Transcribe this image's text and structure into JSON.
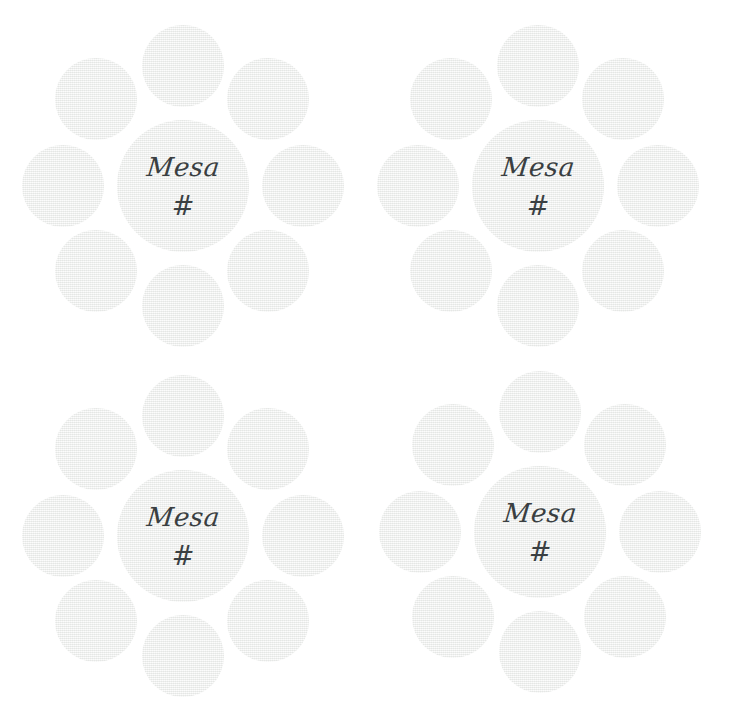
{
  "page": {
    "background_color": "#ffffff",
    "width": 729,
    "height": 713
  },
  "style": {
    "circle_fill": "#f1f2f1",
    "label_color": "#3a3f42",
    "texture": "linen-weave"
  },
  "cluster_template": {
    "center_label_name": "Mesa",
    "center_label_hash": "#",
    "satellite_count": 8,
    "satellite_positions": [
      "n",
      "ne",
      "e",
      "se",
      "s",
      "sw",
      "w",
      "nw"
    ]
  },
  "clusters": [
    {
      "id": "top-left",
      "name": "Mesa",
      "hash": "#",
      "satellites": [
        {
          "position": "n"
        },
        {
          "position": "ne"
        },
        {
          "position": "e"
        },
        {
          "position": "se"
        },
        {
          "position": "s"
        },
        {
          "position": "sw"
        },
        {
          "position": "w"
        },
        {
          "position": "nw"
        }
      ]
    },
    {
      "id": "top-right",
      "name": "Mesa",
      "hash": "#",
      "satellites": [
        {
          "position": "n"
        },
        {
          "position": "ne"
        },
        {
          "position": "e"
        },
        {
          "position": "se"
        },
        {
          "position": "s"
        },
        {
          "position": "sw"
        },
        {
          "position": "w"
        },
        {
          "position": "nw"
        }
      ]
    },
    {
      "id": "bottom-left",
      "name": "Mesa",
      "hash": "#",
      "satellites": [
        {
          "position": "n"
        },
        {
          "position": "ne"
        },
        {
          "position": "e"
        },
        {
          "position": "se"
        },
        {
          "position": "s"
        },
        {
          "position": "sw"
        },
        {
          "position": "w"
        },
        {
          "position": "nw"
        }
      ]
    },
    {
      "id": "bottom-right",
      "name": "Mesa",
      "hash": "#",
      "satellites": [
        {
          "position": "n"
        },
        {
          "position": "ne"
        },
        {
          "position": "e"
        },
        {
          "position": "se"
        },
        {
          "position": "s"
        },
        {
          "position": "sw"
        },
        {
          "position": "w"
        },
        {
          "position": "nw"
        }
      ]
    }
  ]
}
